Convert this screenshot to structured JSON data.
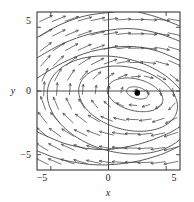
{
  "chart_data": {
    "type": "scatter",
    "title": "",
    "subtitle": "",
    "xlabel": "x",
    "ylabel": "y",
    "xlim": [
      -6.2,
      6.2
    ],
    "ylim": [
      -6.2,
      6.2
    ],
    "grid": false,
    "legend": null,
    "xticks": [
      -5,
      0,
      5
    ],
    "xticklabels": [
      "−5",
      "0",
      "5"
    ],
    "yticks": [
      -5,
      0,
      5
    ],
    "yticklabels": [
      "−5",
      "0",
      "5"
    ],
    "axis_lines": {
      "x_axis_at_y": 0,
      "y_axis_at_x": 0
    },
    "center_point": {
      "x": 2.5,
      "y": -0.15,
      "marker": "filled-circle"
    },
    "orbits": [
      {
        "name": "innermost-closed-orbit",
        "cx": 2.5,
        "cy": -0.15,
        "rx": 0.95,
        "ry": 0.45,
        "rot": -12,
        "closed": true
      },
      {
        "name": "inner-closed-orbit",
        "cx": 2.3,
        "cy": -0.3,
        "rx": 2.45,
        "ry": 1.25,
        "rot": -12,
        "closed": true
      },
      {
        "name": "mid-closed-orbit",
        "cx": 1.7,
        "cy": -0.6,
        "rx": 4.35,
        "ry": 2.45,
        "rot": -12,
        "closed": true
      },
      {
        "name": "outer-closed-orbit",
        "cx": 0.9,
        "cy": -1.1,
        "rx": 6.3,
        "ry": 3.7,
        "rot": -12,
        "closed": true
      }
    ],
    "open_curves": [
      {
        "name": "open-curve-1",
        "points": [
          [
            -6.2,
            1.0
          ],
          [
            -4.0,
            2.2
          ],
          [
            -1.5,
            3.1
          ],
          [
            1.5,
            3.5
          ],
          [
            4.0,
            3.2
          ],
          [
            6.2,
            2.4
          ]
        ]
      },
      {
        "name": "open-curve-2",
        "points": [
          [
            -6.2,
            2.6
          ],
          [
            -4.0,
            3.7
          ],
          [
            -1.5,
            4.5
          ],
          [
            1.5,
            4.9
          ],
          [
            4.0,
            4.6
          ],
          [
            6.2,
            3.9
          ]
        ]
      },
      {
        "name": "open-curve-3",
        "points": [
          [
            -6.2,
            4.2
          ],
          [
            -4.2,
            5.2
          ],
          [
            -2.0,
            5.9
          ],
          [
            0.5,
            6.2
          ]
        ]
      },
      {
        "name": "open-curve-4",
        "points": [
          [
            2.6,
            6.2
          ],
          [
            4.2,
            5.8
          ],
          [
            6.2,
            5.1
          ]
        ]
      },
      {
        "name": "open-curve-5",
        "points": [
          [
            -6.2,
            -4.7
          ],
          [
            -4.0,
            -5.4
          ],
          [
            -1.0,
            -5.8
          ],
          [
            2.0,
            -5.6
          ],
          [
            4.5,
            -5.0
          ],
          [
            6.2,
            -4.3
          ]
        ]
      },
      {
        "name": "open-curve-6",
        "points": [
          [
            -6.2,
            -3.2
          ],
          [
            -3.5,
            -4.2
          ],
          [
            -0.5,
            -4.6
          ],
          [
            2.5,
            -4.2
          ],
          [
            5.0,
            -3.4
          ],
          [
            6.2,
            -2.8
          ]
        ]
      }
    ],
    "vector_field": {
      "marker": "arrow",
      "note": "arrows circulate clockwise about the center; leftward above the center line, rightward below",
      "grid_spacing": 1.1
    }
  },
  "axes": {
    "x_axis_label": "x",
    "y_axis_label": "y",
    "x_tick_labels": [
      "−5",
      "0",
      "5"
    ],
    "y_tick_labels": [
      "5",
      "0",
      "−5"
    ]
  },
  "colors": {
    "frame": "#3a3a3a",
    "curve": "#5a5a5a",
    "arrow": "#4a4a4a",
    "text": "#1a1a1a",
    "point": "#000000",
    "background": "#ffffff"
  }
}
